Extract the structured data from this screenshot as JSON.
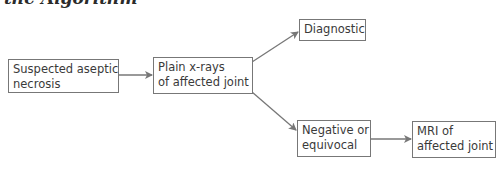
{
  "heading": {
    "text": "the Algorithm"
  },
  "flowchart": {
    "nodes": [
      {
        "id": "suspected",
        "lines": [
          "Suspected aseptic",
          "necrosis"
        ]
      },
      {
        "id": "xrays",
        "lines": [
          "Plain x-rays",
          "of affected joint"
        ]
      },
      {
        "id": "diagnostic",
        "lines": [
          "Diagnostic"
        ]
      },
      {
        "id": "negative",
        "lines": [
          "Negative or",
          "equivocal"
        ]
      },
      {
        "id": "mri",
        "lines": [
          "MRI of",
          "affected joint"
        ]
      }
    ],
    "edges": [
      {
        "from": "suspected",
        "to": "xrays"
      },
      {
        "from": "xrays",
        "to": "diagnostic"
      },
      {
        "from": "xrays",
        "to": "negative"
      },
      {
        "from": "negative",
        "to": "mri"
      }
    ],
    "colors": {
      "border": "#777777",
      "arrow": "#777777",
      "text": "#3a3a3a"
    }
  }
}
